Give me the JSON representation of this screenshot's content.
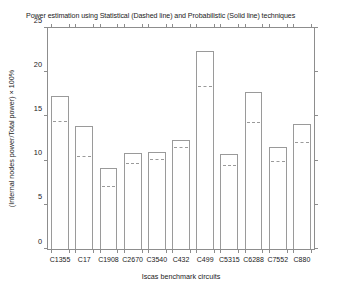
{
  "chart_data": {
    "type": "bar",
    "title": "Power estimation using Statistical (Dashed line) and Probabilistic (Solid line) techniques",
    "xlabel": "Iscas benchmark circuits",
    "ylabel": "(Internal nodes power/Total power) × 100%",
    "categories": [
      "C1355",
      "C17",
      "C1908",
      "C2670",
      "C3540",
      "C432",
      "C499",
      "C5315",
      "C6288",
      "C7552",
      "C880"
    ],
    "ylim": [
      0,
      25
    ],
    "yticks": [
      0,
      5,
      10,
      15,
      20,
      25
    ],
    "ytick_labels": [
      "0",
      "5",
      "10",
      "15",
      "20",
      "25"
    ],
    "grid": false,
    "legend": "none",
    "series": [
      {
        "name": "Probabilistic (Solid line)",
        "style": "solid-bar-outline",
        "values": [
          17.3,
          13.9,
          9.2,
          10.9,
          11.0,
          12.3,
          22.4,
          10.7,
          17.8,
          11.5,
          14.1
        ]
      },
      {
        "name": "Statistical (Dashed line)",
        "style": "dashed-line",
        "values": [
          14.4,
          10.4,
          7.0,
          9.6,
          10.1,
          11.4,
          18.3,
          9.4,
          14.2,
          9.8,
          12.0
        ]
      }
    ]
  },
  "axes": {
    "y_title": "(Internal nodes power/Total power) × 100%",
    "x_title": "Iscas benchmark circuits"
  }
}
